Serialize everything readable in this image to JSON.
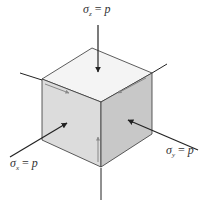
{
  "figure": {
    "type": "stress-element-cube"
  },
  "labels": {
    "z": {
      "symbol": "σ",
      "subscript": "z",
      "equals": " = ",
      "value": "p"
    },
    "x": {
      "symbol": "σ",
      "subscript": "x",
      "equals": " = ",
      "value": "p"
    },
    "y": {
      "symbol": "σ",
      "subscript": "y",
      "equals": " = ",
      "value": "p"
    }
  },
  "colors": {
    "top_face": "#f4f4f4",
    "left_face": "#dcdcdc",
    "right_face": "#c8c8c8",
    "edge": "#333333",
    "arrow": "#222222",
    "shear_arrow": "#888888",
    "axis": "#222222"
  },
  "caption": ""
}
